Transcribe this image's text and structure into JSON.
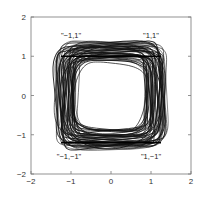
{
  "chart_data": {
    "type": "line",
    "title": "",
    "xlabel": "",
    "ylabel": "",
    "xlim": [
      -2,
      2
    ],
    "ylim": [
      -2,
      2
    ],
    "grid": false,
    "legend": null,
    "xticks": [
      -2,
      -1,
      0,
      1,
      2
    ],
    "yticks": [
      -2,
      -1,
      0,
      1,
      2
    ],
    "xtick_labels": [
      "−2",
      "−1",
      "0",
      "1",
      "2"
    ],
    "ytick_labels": [
      "−2",
      "−1",
      "0",
      "1",
      "2"
    ],
    "annotations": [
      {
        "text": "\"−1,1\"",
        "x": -1.0,
        "y": 1.55
      },
      {
        "text": "\"1,1\"",
        "x": 1.0,
        "y": 1.55
      },
      {
        "text": "\"−1,−1\"",
        "x": -1.05,
        "y": -1.55
      },
      {
        "text": "\"1,−1\"",
        "x": 1.0,
        "y": -1.55
      }
    ],
    "series": [
      {
        "name": "trajectories",
        "shape": "superellipse",
        "count": 46,
        "outer_half_width": 1.3,
        "inner_radius": 0.88,
        "color": "#111111"
      }
    ]
  }
}
